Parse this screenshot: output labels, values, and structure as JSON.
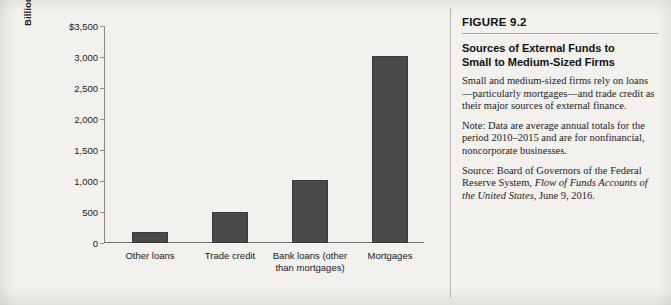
{
  "chart_data": {
    "type": "bar",
    "title": "",
    "xlabel": "",
    "ylabel": "Billions of dollars",
    "ylim": [
      0,
      3500
    ],
    "grid": false,
    "legend": "none",
    "bar_color": "#4a4a4a",
    "categories": [
      "Other loans",
      "Trade credit",
      "Bank loans (other\nthan mortgages)",
      "Mortgages"
    ],
    "values": [
      180,
      500,
      1020,
      3010
    ],
    "ytick_labels": [
      "$3,500",
      "3,000",
      "2,500",
      "2,000",
      "1,500",
      "1,000",
      "500",
      "0"
    ],
    "ytick_values": [
      3500,
      3000,
      2500,
      2000,
      1500,
      1000,
      500,
      0
    ]
  },
  "caption": {
    "figure_number": "FIGURE 9.2",
    "title_line_1": "Sources of External Funds to",
    "title_line_2": "Small to Medium-Sized Firms",
    "body": "Small and medium-sized firms rely on loans—particularly mortgages—and trade credit as their major sources of external finance.",
    "note": "Note: Data are average annual totals for the period 2010–2015 and are for nonfinancial, noncorporate businesses.",
    "source_prefix": "Source: Board of Governors of the Federal Reserve System, ",
    "source_italic": "Flow of Funds Accounts of the United States,",
    "source_suffix": " June 9, 2016."
  },
  "colors": {
    "page_background": "#f2f1ee",
    "bar_fill": "#4a4a4a",
    "axis": "#6d6d6d",
    "divider": "#b9b6b0",
    "text": "#1a1a1a"
  }
}
